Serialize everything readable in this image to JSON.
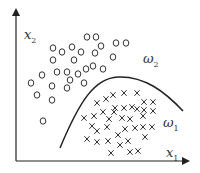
{
  "diagram": {
    "type": "scatter_classification",
    "axes": {
      "x_label": "x",
      "x_sub": "1",
      "y_label": "x",
      "y_sub": "2"
    },
    "classes": [
      {
        "name": "ω",
        "sub": "2",
        "marker": "circle"
      },
      {
        "name": "ω",
        "sub": "1",
        "marker": "cross"
      }
    ],
    "colors": {
      "ink": "#222222",
      "background": "#ffffff"
    }
  },
  "chart_data": {
    "type": "scatter",
    "title": "",
    "xlabel": "x1",
    "ylabel": "x2",
    "grid": false,
    "legend": "inline labels",
    "series": [
      {
        "name": "ω2",
        "marker": "o",
        "points_px": [
          [
            87,
            37
          ],
          [
            96,
            37
          ],
          [
            53,
            48
          ],
          [
            62,
            52
          ],
          [
            72,
            47
          ],
          [
            81,
            52
          ],
          [
            95,
            53
          ],
          [
            101,
            46
          ],
          [
            116,
            43
          ],
          [
            126,
            43
          ],
          [
            53,
            60
          ],
          [
            74,
            60
          ],
          [
            113,
            57
          ],
          [
            42,
            75
          ],
          [
            57,
            72
          ],
          [
            67,
            72
          ],
          [
            78,
            74
          ],
          [
            86,
            69
          ],
          [
            93,
            66
          ],
          [
            103,
            69
          ],
          [
            31,
            83
          ],
          [
            52,
            86
          ],
          [
            70,
            80
          ],
          [
            84,
            83
          ],
          [
            67,
            88
          ],
          [
            37,
            95
          ],
          [
            52,
            100
          ],
          [
            43,
            121
          ]
        ]
      },
      {
        "name": "ω1",
        "marker": "x",
        "points_px": [
          [
            113,
            95
          ],
          [
            124,
            93
          ],
          [
            137,
            93
          ],
          [
            97,
            103
          ],
          [
            106,
            99
          ],
          [
            144,
            102
          ],
          [
            153,
            102
          ],
          [
            103,
            112
          ],
          [
            115,
            108
          ],
          [
            124,
            108
          ],
          [
            132,
            107
          ],
          [
            137,
            109
          ],
          [
            144,
            110
          ],
          [
            153,
            111
          ],
          [
            114,
            112
          ],
          [
            84,
            118
          ],
          [
            94,
            116
          ],
          [
            109,
            119
          ],
          [
            122,
            118
          ],
          [
            130,
            119
          ],
          [
            143,
            116
          ],
          [
            92,
            126
          ],
          [
            97,
            131
          ],
          [
            107,
            127
          ],
          [
            125,
            129
          ],
          [
            135,
            128
          ],
          [
            143,
            127
          ],
          [
            152,
            127
          ],
          [
            118,
            135
          ],
          [
            87,
            139
          ],
          [
            97,
            142
          ],
          [
            108,
            141
          ],
          [
            120,
            145
          ],
          [
            128,
            141
          ],
          [
            145,
            137
          ],
          [
            111,
            153
          ],
          [
            130,
            152
          ],
          [
            138,
            151
          ]
        ]
      }
    ],
    "decision_boundary": {
      "shape": "arch curve",
      "from_px": [
        60,
        148
      ],
      "peak_px": [
        118,
        77
      ],
      "to_px": [
        183,
        111
      ]
    }
  }
}
